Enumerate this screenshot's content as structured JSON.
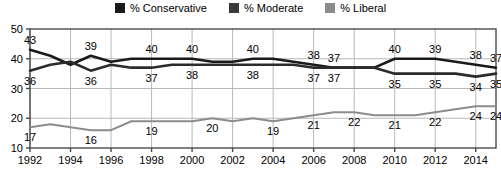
{
  "legend": {
    "items": [
      {
        "label": "% Conservative",
        "color": "#1a1a1a",
        "name": "legend-conservative"
      },
      {
        "label": "% Moderate",
        "color": "#3a3a3a",
        "name": "legend-moderate"
      },
      {
        "label": "% Liberal",
        "color": "#8c8c8c",
        "name": "legend-liberal"
      }
    ]
  },
  "chart_data": {
    "type": "line",
    "title": "",
    "xlabel": "",
    "ylabel": "",
    "ylim": [
      10,
      50
    ],
    "yticks": [
      10,
      20,
      30,
      40,
      50
    ],
    "xlim": [
      1992,
      2015
    ],
    "xticks": [
      1992,
      1994,
      1996,
      1998,
      2000,
      2002,
      2004,
      2006,
      2008,
      2010,
      2012,
      2014
    ],
    "grid": true,
    "legend_position": "top-center",
    "x": [
      1992,
      1993,
      1994,
      1995,
      1996,
      1997,
      1998,
      1999,
      2000,
      2001,
      2002,
      2003,
      2004,
      2005,
      2006,
      2007,
      2008,
      2009,
      2010,
      2011,
      2012,
      2013,
      2014,
      2015
    ],
    "series": [
      {
        "name": "% Conservative",
        "color": "#1a1a1a",
        "values": [
          43,
          41,
          38,
          41,
          39,
          40,
          40,
          40,
          40,
          39,
          39,
          40,
          40,
          39,
          38,
          37,
          37,
          37,
          40,
          40,
          40,
          39,
          38,
          37
        ],
        "labels": [
          {
            "x": 1992,
            "value": 43
          },
          {
            "x": 1995,
            "value": 39
          },
          {
            "x": 1998,
            "value": 40
          },
          {
            "x": 2000,
            "value": 40
          },
          {
            "x": 2003,
            "value": 40
          },
          {
            "x": 2006,
            "value": 38
          },
          {
            "x": 2007,
            "value": 37
          },
          {
            "x": 2010,
            "value": 40
          },
          {
            "x": 2012,
            "value": 39
          },
          {
            "x": 2014,
            "value": 38
          },
          {
            "x": 2015,
            "value": 37
          }
        ]
      },
      {
        "name": "% Moderate",
        "color": "#2b2b2b",
        "values": [
          36,
          38,
          39,
          36,
          38,
          37,
          37,
          38,
          38,
          38,
          38,
          38,
          38,
          38,
          37,
          37,
          37,
          37,
          35,
          35,
          35,
          35,
          34,
          35
        ],
        "labels": [
          {
            "x": 1992,
            "value": 36
          },
          {
            "x": 1995,
            "value": 36
          },
          {
            "x": 1998,
            "value": 37
          },
          {
            "x": 2000,
            "value": 38
          },
          {
            "x": 2003,
            "value": 38
          },
          {
            "x": 2006,
            "value": 37
          },
          {
            "x": 2007,
            "value": 37
          },
          {
            "x": 2010,
            "value": 35
          },
          {
            "x": 2012,
            "value": 35
          },
          {
            "x": 2014,
            "value": 34
          },
          {
            "x": 2015,
            "value": 35
          }
        ]
      },
      {
        "name": "% Liberal",
        "color": "#8c8c8c",
        "values": [
          17,
          18,
          17,
          16,
          16,
          19,
          19,
          19,
          19,
          20,
          19,
          20,
          19,
          20,
          21,
          22,
          22,
          21,
          21,
          21,
          22,
          23,
          24,
          24
        ],
        "labels": [
          {
            "x": 1992,
            "value": 17
          },
          {
            "x": 1995,
            "value": 16
          },
          {
            "x": 1998,
            "value": 19
          },
          {
            "x": 2001,
            "value": 20
          },
          {
            "x": 2004,
            "value": 19
          },
          {
            "x": 2006,
            "value": 21
          },
          {
            "x": 2008,
            "value": 22
          },
          {
            "x": 2010,
            "value": 21
          },
          {
            "x": 2012,
            "value": 22
          },
          {
            "x": 2014,
            "value": 24
          },
          {
            "x": 2015,
            "value": 24
          }
        ]
      }
    ]
  }
}
